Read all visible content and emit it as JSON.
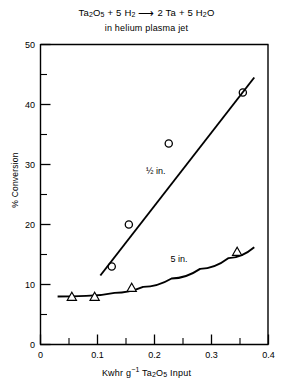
{
  "chart_data": {
    "type": "scatter",
    "subtitle": "in helium plasma jet",
    "xlabel": "Kwhr g-1 Ta2O5 Input",
    "ylabel": "% Conversion",
    "xlim": [
      0,
      0.4
    ],
    "ylim": [
      0,
      50
    ],
    "xticks": [
      0,
      0.1,
      0.2,
      0.3,
      0.4
    ],
    "xtick_labels": [
      "0",
      "0.1",
      "0.2",
      "0.3",
      "0.4"
    ],
    "xticks_minor": [
      0.05,
      0.15,
      0.25,
      0.35
    ],
    "yticks": [
      0,
      10,
      20,
      30,
      40,
      50
    ],
    "ytick_labels": [
      "0",
      "10",
      "20",
      "30",
      "40",
      "50"
    ],
    "yticks_minor": [
      5,
      15,
      25,
      35,
      45
    ],
    "grid": false,
    "legend": "inline annotations",
    "series": [
      {
        "name": "1/2 in.",
        "label": "½ in.",
        "marker": "circle-open",
        "points": [
          {
            "x": 0.125,
            "y": 13.0
          },
          {
            "x": 0.155,
            "y": 20.0
          },
          {
            "x": 0.225,
            "y": 33.5
          },
          {
            "x": 0.355,
            "y": 42.0
          }
        ],
        "fit_line": [
          {
            "x": 0.105,
            "y": 11.5
          },
          {
            "x": 0.375,
            "y": 44.5
          }
        ],
        "label_position": {
          "x": 0.185,
          "y": 28.5
        }
      },
      {
        "name": "5 in.",
        "label": "5 in.",
        "marker": "triangle-open",
        "points": [
          {
            "x": 0.055,
            "y": 8.0
          },
          {
            "x": 0.095,
            "y": 8.0
          },
          {
            "x": 0.16,
            "y": 9.5
          },
          {
            "x": 0.345,
            "y": 15.5
          }
        ],
        "fit_curve": [
          {
            "x": 0.03,
            "y": 8.0
          },
          {
            "x": 0.08,
            "y": 8.1
          },
          {
            "x": 0.13,
            "y": 8.6
          },
          {
            "x": 0.18,
            "y": 9.6
          },
          {
            "x": 0.23,
            "y": 11.0
          },
          {
            "x": 0.28,
            "y": 12.6
          },
          {
            "x": 0.33,
            "y": 14.4
          },
          {
            "x": 0.375,
            "y": 16.2
          }
        ],
        "label_position": {
          "x": 0.228,
          "y": 13.7
        }
      }
    ]
  },
  "title": {
    "formula_prefix": "Ta",
    "formula_sub1": "2",
    "formula_mid1": "O",
    "formula_sub2": "5",
    "formula_plus1": " + 5 H",
    "formula_sub3": "2",
    "formula_arrow": "⟶",
    "formula_tail": " 2 Ta + 5 H",
    "formula_sub4": "2",
    "formula_end": "O",
    "subtitle": "in helium plasma jet"
  },
  "axes": {
    "xlabel_part1": "Kwhr g",
    "xlabel_sup": "−1",
    "xlabel_part2": " Ta",
    "xlabel_sub1": "2",
    "xlabel_part3": "O",
    "xlabel_sub2": "5",
    "xlabel_part4": " Input",
    "ylabel": "% Conversion"
  }
}
